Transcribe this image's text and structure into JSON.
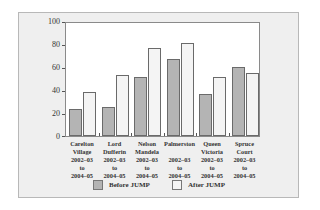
{
  "chart_data": {
    "type": "bar",
    "title": "",
    "xlabel": "",
    "ylabel": "",
    "ylim": [
      0,
      100
    ],
    "yticks": [
      0,
      20,
      40,
      60,
      80,
      100
    ],
    "grid": false,
    "legend_position": "bottom",
    "categories": [
      "Carelton Village 2002–03 to 2004–05",
      "Lord Dufferin 2002–03 to 2004–05",
      "Nelson Mandela 2002–03 to 2004–05",
      "Palmerston 2002–03 to 2004–05",
      "Queen Victoria 2002–03 to 2004–05",
      "Spruce Court 2002–03 to 2004–05"
    ],
    "category_lines": [
      [
        "Carelton",
        "Village",
        "2002–03",
        "to",
        "2004–05"
      ],
      [
        "Lord",
        "Dufferin",
        "2002–03",
        "to",
        "2004–05"
      ],
      [
        "Nelson",
        "Mandela",
        "2002–03",
        "to",
        "2004–05"
      ],
      [
        "Palmerston",
        "",
        "2002–03",
        "to",
        "2004–05"
      ],
      [
        "Queen",
        "Victoria",
        "2002–03",
        "to",
        "2004–05"
      ],
      [
        "Spruce",
        "Court",
        "2002–03",
        "to",
        "2004–05"
      ]
    ],
    "series": [
      {
        "name": "Before JUMP",
        "color": "#b4b4b4",
        "values": [
          24,
          26,
          52,
          68,
          37,
          61
        ]
      },
      {
        "name": "After JUMP",
        "color": "#f4f4f4",
        "values": [
          39,
          54,
          78,
          82,
          52,
          56
        ]
      }
    ]
  },
  "legend": {
    "before_label": "Before JUMP",
    "after_label": "After JUMP"
  },
  "yaxis": {
    "t0": "0",
    "t20": "20",
    "t40": "40",
    "t60": "60",
    "t80": "80",
    "t100": "100"
  }
}
